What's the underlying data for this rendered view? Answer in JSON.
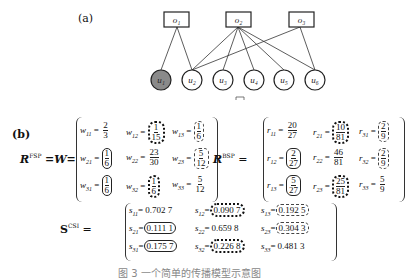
{
  "panel_a": {
    "label": "(a)",
    "objects": [
      "o1",
      "o2",
      "o3"
    ],
    "users": [
      "u1",
      "u2",
      "u3",
      "u4",
      "u5",
      "u6"
    ],
    "highlighted_user": "u1",
    "edges": [
      [
        "o1",
        "u1"
      ],
      [
        "o1",
        "u2"
      ],
      [
        "o2",
        "u2"
      ],
      [
        "o2",
        "u3"
      ],
      [
        "o2",
        "u4"
      ],
      [
        "o2",
        "u5"
      ],
      [
        "o2",
        "u6"
      ],
      [
        "o3",
        "u2"
      ],
      [
        "o3",
        "u6"
      ]
    ]
  },
  "panel_b": {
    "label": "(b)",
    "fsp": {
      "lhs": "R",
      "sup": "FSP",
      "eq": "=W=",
      "cells": [
        {
          "name": "w11",
          "sub": "11",
          "num": "2",
          "den": "3",
          "box": "none"
        },
        {
          "name": "w12",
          "sub": "12",
          "num": "1",
          "den": "15",
          "box": "dotted"
        },
        {
          "name": "w13",
          "sub": "13",
          "num": "1",
          "den": "6",
          "box": "dashed"
        },
        {
          "name": "w21",
          "sub": "21",
          "num": "1",
          "den": "6",
          "box": "solid"
        },
        {
          "name": "w22",
          "sub": "22",
          "num": "23",
          "den": "30",
          "box": "none"
        },
        {
          "name": "w23",
          "sub": "23",
          "num": "5",
          "den": "12",
          "box": "dashed"
        },
        {
          "name": "w31",
          "sub": "31",
          "num": "1",
          "den": "6",
          "box": "solid"
        },
        {
          "name": "w32",
          "sub": "32",
          "num": "1",
          "den": "6",
          "box": "dotted"
        },
        {
          "name": "w33",
          "sub": "33",
          "num": "5",
          "den": "12",
          "box": "none"
        }
      ]
    },
    "bsp": {
      "lhs": "R",
      "sup": "BSP",
      "eq": "=",
      "cells": [
        {
          "name": "r11",
          "sub": "11",
          "num": "20",
          "den": "27",
          "box": "none"
        },
        {
          "name": "r21",
          "sub": "21",
          "num": "10",
          "den": "81",
          "box": "dotted"
        },
        {
          "name": "r31",
          "sub": "31",
          "num": "2",
          "den": "9",
          "box": "dashed"
        },
        {
          "name": "r12",
          "sub": "12",
          "num": "2",
          "den": "27",
          "box": "solid"
        },
        {
          "name": "r22",
          "sub": "22",
          "num": "46",
          "den": "81",
          "box": "none"
        },
        {
          "name": "r32",
          "sub": "32",
          "num": "2",
          "den": "9",
          "box": "dashed"
        },
        {
          "name": "r13",
          "sub": "13",
          "num": "5",
          "den": "27",
          "box": "solid"
        },
        {
          "name": "r23",
          "sub": "23",
          "num": "25",
          "den": "81",
          "box": "dotted"
        },
        {
          "name": "r33",
          "sub": "33",
          "num": "5",
          "den": "9",
          "box": "none"
        }
      ]
    },
    "csi": {
      "lhs": "S",
      "sup": "CSI",
      "eq": "=",
      "cells": [
        {
          "name": "s11",
          "sub": "11",
          "val": "0.702 7",
          "box": "none"
        },
        {
          "name": "s12",
          "sub": "12",
          "val": "0.090 7",
          "box": "dotted"
        },
        {
          "name": "s13",
          "sub": "13",
          "val": "0.192 5",
          "box": "dashed"
        },
        {
          "name": "s21",
          "sub": "21",
          "val": "0.111 1",
          "box": "solid"
        },
        {
          "name": "s22",
          "sub": "22",
          "val": "0.659 8",
          "box": "none"
        },
        {
          "name": "s23",
          "sub": "23",
          "val": "0.304 3",
          "box": "dashed"
        },
        {
          "name": "s31",
          "sub": "31",
          "val": "0.175 7",
          "box": "solid"
        },
        {
          "name": "s32",
          "sub": "32",
          "val": "0.226 8",
          "box": "dotted"
        },
        {
          "name": "s33",
          "sub": "33",
          "val": "0.481 3",
          "box": "none"
        }
      ]
    }
  },
  "caption": "图 3  一个简单的传播模型示意图"
}
